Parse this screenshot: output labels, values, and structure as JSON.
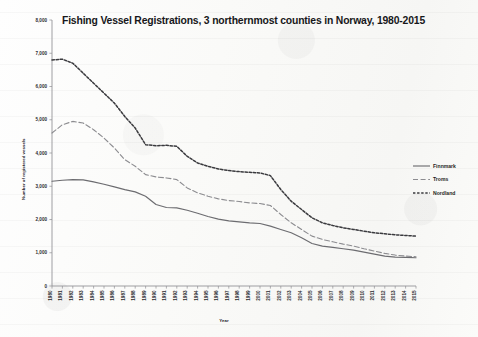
{
  "chart_data": {
    "type": "line",
    "title": "Fishing Vessel Registrations, 3 northernmost counties in Norway, 1980-2015",
    "xlabel": "Year",
    "ylabel": "Number of registered vessels",
    "ylim": [
      0,
      8000
    ],
    "ytick_labels": [
      "8,000",
      "7,000",
      "6,000",
      "5,000",
      "4,000",
      "3,000",
      "2,000",
      "1,000",
      "0"
    ],
    "ytick_values": [
      8000,
      7000,
      6000,
      5000,
      4000,
      3000,
      2000,
      1000,
      0
    ],
    "grid": false,
    "legend_position": "right",
    "x": [
      1980,
      1981,
      1982,
      1983,
      1984,
      1985,
      1986,
      1987,
      1988,
      1989,
      1990,
      1991,
      1992,
      1993,
      1994,
      1995,
      1996,
      1997,
      1998,
      1999,
      2000,
      2001,
      2002,
      2003,
      2004,
      2005,
      2006,
      2007,
      2008,
      2009,
      2010,
      2011,
      2012,
      2013,
      2014,
      2015
    ],
    "categories": [
      "1980",
      "1981",
      "1982",
      "1983",
      "1984",
      "1985",
      "1986",
      "1987",
      "1988",
      "1989",
      "1990",
      "1991",
      "1992",
      "1993",
      "1994",
      "1995",
      "1996",
      "1997",
      "1998",
      "1999",
      "2000",
      "2001",
      "2002",
      "2003",
      "2004",
      "2005",
      "2006",
      "2007",
      "2008",
      "2009",
      "2010",
      "2011",
      "2012",
      "2013",
      "2014",
      "2015"
    ],
    "series": [
      {
        "name": "Finnmark",
        "style": "solid",
        "color": "#6c6c70",
        "values": [
          3150,
          3180,
          3200,
          3190,
          3130,
          3060,
          2980,
          2900,
          2830,
          2700,
          2450,
          2360,
          2350,
          2280,
          2190,
          2090,
          2010,
          1960,
          1930,
          1900,
          1880,
          1800,
          1700,
          1600,
          1450,
          1280,
          1200,
          1160,
          1120,
          1080,
          1020,
          960,
          900,
          870,
          860,
          850
        ]
      },
      {
        "name": "Troms",
        "style": "dashed",
        "color": "#8c8c90",
        "values": [
          4600,
          4850,
          4950,
          4900,
          4700,
          4450,
          4150,
          3800,
          3600,
          3350,
          3280,
          3250,
          3200,
          2950,
          2800,
          2700,
          2620,
          2570,
          2540,
          2500,
          2480,
          2420,
          2150,
          1900,
          1700,
          1500,
          1400,
          1330,
          1260,
          1200,
          1120,
          1050,
          980,
          930,
          900,
          880
        ]
      },
      {
        "name": "Nordland",
        "style": "dash-dense",
        "color": "#3a3a3e",
        "values": [
          6800,
          6820,
          6700,
          6400,
          6100,
          5800,
          5500,
          5100,
          4750,
          4250,
          4220,
          4230,
          4200,
          3900,
          3700,
          3600,
          3520,
          3470,
          3440,
          3420,
          3400,
          3320,
          2900,
          2550,
          2300,
          2050,
          1900,
          1820,
          1750,
          1700,
          1650,
          1600,
          1570,
          1540,
          1520,
          1500
        ]
      }
    ]
  },
  "legend": {
    "items": [
      {
        "label": "Finnmark"
      },
      {
        "label": "Troms"
      },
      {
        "label": "Nordland"
      }
    ]
  }
}
